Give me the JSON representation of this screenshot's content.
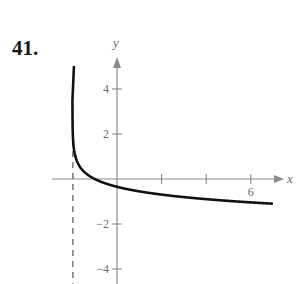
{
  "problem": {
    "number": "41."
  },
  "chart_data": {
    "type": "line",
    "title": "",
    "xlabel": "x",
    "ylabel": "y",
    "xlim": [
      -2.8,
      7.5
    ],
    "ylim": [
      -4.6,
      5.5
    ],
    "grid": false,
    "x_ticks": [
      2,
      4,
      6
    ],
    "x_tick_labels": [
      "",
      "",
      "6"
    ],
    "y_ticks": [
      4,
      2,
      -2,
      -4
    ],
    "y_tick_labels": [
      "4",
      "2",
      "−2",
      "−4"
    ],
    "asymptote": {
      "type": "vertical",
      "x": -2,
      "style": "dashed"
    },
    "series": [
      {
        "name": "f(x)",
        "description": "decreasing logarithmic curve, vertical asymptote x = -2, passes through (-1, 0)",
        "x": [
          -1.98,
          -1.95,
          -1.9,
          -1.8,
          -1.6,
          -1.4,
          -1.2,
          -1.0,
          -0.5,
          0,
          1,
          2,
          3,
          4,
          5,
          6,
          7
        ],
        "y": [
          2.3,
          1.84,
          1.5,
          1.15,
          0.69,
          0.45,
          0.2,
          0.0,
          -0.2,
          -0.35,
          -0.55,
          -0.69,
          -0.8,
          -0.9,
          -0.97,
          -1.04,
          -1.1
        ]
      }
    ]
  },
  "colors": {
    "axis": "#8a8a8a",
    "curve": "#111111",
    "asymptote": "#555555"
  }
}
